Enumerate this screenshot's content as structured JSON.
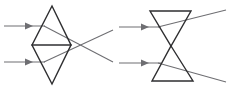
{
  "figure": {
    "width": 229,
    "height": 90,
    "background_color": "#ffffff",
    "ray_color": "#6e6e72",
    "element_color": "#2e2e30"
  },
  "panels": [
    {
      "id": "left-panel",
      "name": "converging-element-diagram",
      "element_shape": "double-triangle-diamond",
      "behavior": "converging",
      "element": {
        "top_apex": [
          52,
          6
        ],
        "left_mid": [
          32,
          45
        ],
        "right_mid": [
          71,
          45
        ],
        "bottom_apex": [
          52,
          84
        ],
        "mid_line": [
          [
            32,
            45
          ],
          [
            71,
            45
          ]
        ]
      },
      "incoming_rays": [
        {
          "name": "upper-incoming-ray",
          "start": [
            4,
            26
          ],
          "end": [
            44,
            26
          ],
          "arrow_at": [
            31,
            26
          ]
        },
        {
          "name": "lower-incoming-ray",
          "start": [
            4,
            62
          ],
          "end": [
            44,
            62
          ],
          "arrow_at": [
            31,
            62
          ]
        }
      ],
      "refracted_rays": [
        {
          "name": "upper-refracted-ray",
          "start": [
            44,
            26
          ],
          "end": [
            113,
            62
          ]
        },
        {
          "name": "lower-refracted-ray",
          "start": [
            44,
            62
          ],
          "end": [
            113,
            30
          ]
        }
      ],
      "focus_point": [
        97,
        49
      ]
    },
    {
      "id": "right-panel",
      "name": "diverging-element-diagram",
      "element_shape": "hourglass-bowtie",
      "behavior": "diverging",
      "element": {
        "top_left": [
          150,
          11
        ],
        "top_right": [
          191,
          11
        ],
        "waist": [
          171,
          46
        ],
        "bottom_left": [
          152,
          81
        ],
        "bottom_right": [
          193,
          81
        ]
      },
      "incoming_rays": [
        {
          "name": "upper-incoming-ray",
          "start": [
            119,
            27
          ],
          "end": [
            160,
            27
          ],
          "arrow_at": [
            148,
            27
          ]
        },
        {
          "name": "lower-incoming-ray",
          "start": [
            119,
            63
          ],
          "end": [
            160,
            63
          ],
          "arrow_at": [
            148,
            63
          ]
        }
      ],
      "refracted_rays": [
        {
          "name": "upper-refracted-ray",
          "start": [
            160,
            27
          ],
          "end": [
            226,
            10
          ]
        },
        {
          "name": "lower-refracted-ray",
          "start": [
            160,
            63
          ],
          "end": [
            226,
            82
          ]
        }
      ]
    }
  ],
  "labels": {
    "has_text_labels": false,
    "text_items": []
  }
}
